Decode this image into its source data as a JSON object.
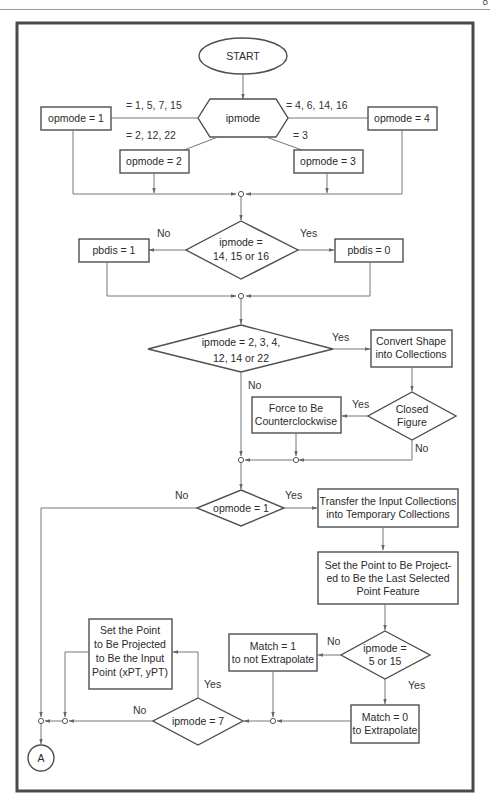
{
  "page": {
    "number_partial": "8"
  },
  "flowchart": {
    "start": {
      "label": "START"
    },
    "ipmode_switch": {
      "label": "ipmode",
      "branches": {
        "left_top": "= 1, 5, 7, 15",
        "left_bottom": "= 2, 12, 22",
        "right_top": "= 4, 6, 14, 16",
        "right_bottom": "= 3"
      }
    },
    "opmode_boxes": {
      "opmode1": "opmode = 1",
      "opmode2": "opmode = 2",
      "opmode3": "opmode = 3",
      "opmode4": "opmode = 4"
    },
    "decision_pbdis": {
      "line1": "ipmode =",
      "line2": "14, 15 or 16",
      "no_label": "No",
      "yes_label": "Yes"
    },
    "pbdis_boxes": {
      "no": "pbdis = 1",
      "yes": "pbdis = 0"
    },
    "decision_shape": {
      "line1": "ipmode = 2, 3, 4,",
      "line2": "12, 14 or 22",
      "yes_label": "Yes",
      "no_label": "No"
    },
    "convert_box": {
      "line1": "Convert Shape",
      "line2": "into Collections"
    },
    "decision_closed": {
      "line1": "Closed",
      "line2": "Figure",
      "yes_label": "Yes",
      "no_label": "No"
    },
    "force_box": {
      "line1": "Force to Be",
      "line2": "Counterclockwise"
    },
    "decision_opmode1": {
      "label": "opmode = 1",
      "no_label": "No",
      "yes_label": "Yes"
    },
    "transfer_box": {
      "line1": "Transfer the Input Collections",
      "line2": "into Temporary Collections"
    },
    "setpoint_last_box": {
      "line1": "Set the Point to Be Project-",
      "line2": "ed to Be the Last Selected",
      "line3": "Point Feature"
    },
    "decision_5_15": {
      "line1": "ipmode =",
      "line2": "5 or 15",
      "no_label": "No",
      "yes_label": "Yes"
    },
    "match1_box": {
      "line1": "Match = 1",
      "line2": "to not Extrapolate"
    },
    "match0_box": {
      "line1": "Match = 0",
      "line2": "to Extrapolate"
    },
    "decision_ipmode7": {
      "label": "ipmode = 7",
      "no_label": "No",
      "yes_label": "Yes"
    },
    "setpoint_input_box": {
      "line1": "Set the Point",
      "line2": "to Be Projected",
      "line3": "to Be the Input",
      "line4": "Point (xPT, yPT)"
    },
    "connector": {
      "label": "A"
    }
  }
}
